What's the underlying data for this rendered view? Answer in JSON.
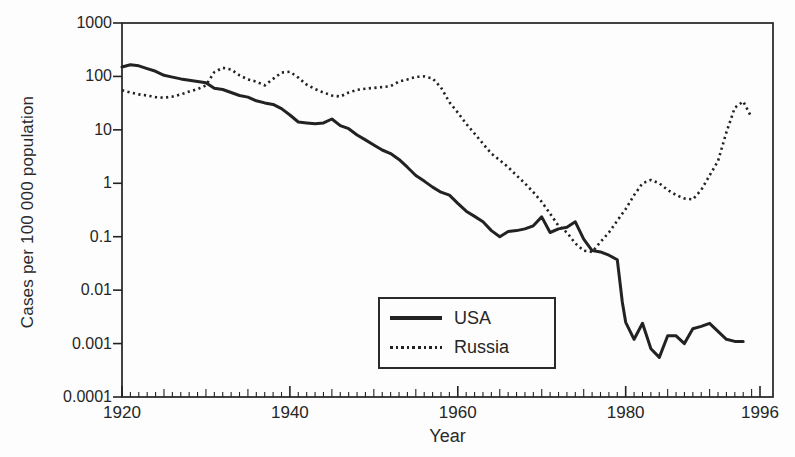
{
  "figure": {
    "background_color": "#fdfdfd",
    "ink_color": "#222222",
    "x_axis_title": "Year",
    "y_axis_title": "Cases per 100 000 population"
  },
  "chart_data": {
    "type": "line",
    "title": "",
    "xlabel": "Year",
    "ylabel": "Cases per 100 000 population",
    "grid": false,
    "x_axis": {
      "min": 1920,
      "max": 1996,
      "major_ticks": [
        1920,
        1940,
        1960,
        1980,
        1996
      ],
      "major_tick_labels": [
        "1920",
        "1940",
        "1960",
        "1980",
        "1996"
      ],
      "minor_tick_interval_years": 1
    },
    "y_axis": {
      "scale": "log",
      "min": 0.0001,
      "max": 1000,
      "ticks": [
        1000,
        100,
        10,
        1,
        0.1,
        0.01,
        0.001,
        0.0001
      ],
      "tick_labels": [
        "1000",
        "100",
        "10",
        "1",
        "0.1",
        "0.01",
        "0.001",
        "0.0001"
      ]
    },
    "legend": {
      "position": "inside-bottom-center",
      "entries": [
        {
          "label": "USA",
          "line_style": "solid"
        },
        {
          "label": "Russia",
          "line_style": "dotted"
        }
      ]
    },
    "series": [
      {
        "name": "USA",
        "line_style": "solid",
        "color": "#222222",
        "points": [
          [
            1920,
            150
          ],
          [
            1921,
            165
          ],
          [
            1922,
            158
          ],
          [
            1923,
            140
          ],
          [
            1924,
            125
          ],
          [
            1925,
            105
          ],
          [
            1926,
            97
          ],
          [
            1927,
            90
          ],
          [
            1928,
            85
          ],
          [
            1929,
            80
          ],
          [
            1930,
            76
          ],
          [
            1931,
            60
          ],
          [
            1932,
            57
          ],
          [
            1933,
            50
          ],
          [
            1934,
            44
          ],
          [
            1935,
            41
          ],
          [
            1936,
            35
          ],
          [
            1937,
            32
          ],
          [
            1938,
            30
          ],
          [
            1939,
            25
          ],
          [
            1940,
            19
          ],
          [
            1941,
            14
          ],
          [
            1942,
            13.5
          ],
          [
            1943,
            13
          ],
          [
            1944,
            13.5
          ],
          [
            1945,
            16
          ],
          [
            1946,
            12
          ],
          [
            1947,
            10.5
          ],
          [
            1948,
            8
          ],
          [
            1949,
            6.5
          ],
          [
            1950,
            5.2
          ],
          [
            1951,
            4.2
          ],
          [
            1952,
            3.6
          ],
          [
            1953,
            2.8
          ],
          [
            1954,
            2.0
          ],
          [
            1955,
            1.4
          ],
          [
            1956,
            1.1
          ],
          [
            1957,
            0.85
          ],
          [
            1958,
            0.68
          ],
          [
            1959,
            0.6
          ],
          [
            1960,
            0.42
          ],
          [
            1961,
            0.3
          ],
          [
            1962,
            0.24
          ],
          [
            1963,
            0.19
          ],
          [
            1964,
            0.13
          ],
          [
            1965,
            0.1
          ],
          [
            1966,
            0.125
          ],
          [
            1967,
            0.13
          ],
          [
            1968,
            0.14
          ],
          [
            1969,
            0.16
          ],
          [
            1970,
            0.235
          ],
          [
            1971,
            0.12
          ],
          [
            1972,
            0.14
          ],
          [
            1973,
            0.15
          ],
          [
            1974,
            0.19
          ],
          [
            1975,
            0.09
          ],
          [
            1976,
            0.055
          ],
          [
            1977,
            0.052
          ],
          [
            1978,
            0.045
          ],
          [
            1979,
            0.037
          ],
          [
            1979.6,
            0.006
          ],
          [
            1980,
            0.0025
          ],
          [
            1981,
            0.0012
          ],
          [
            1982,
            0.0024
          ],
          [
            1983,
            0.0008
          ],
          [
            1984,
            0.00055
          ],
          [
            1985,
            0.0014
          ],
          [
            1986,
            0.0014
          ],
          [
            1987,
            0.001
          ],
          [
            1988,
            0.0019
          ],
          [
            1989,
            0.0021
          ],
          [
            1990,
            0.0024
          ],
          [
            1991,
            0.0017
          ],
          [
            1992,
            0.0012
          ],
          [
            1993,
            0.0011
          ],
          [
            1994,
            0.0011
          ]
        ]
      },
      {
        "name": "Russia",
        "line_style": "dotted",
        "color": "#222222",
        "points": [
          [
            1920,
            55
          ],
          [
            1921,
            50
          ],
          [
            1922,
            46
          ],
          [
            1923,
            44
          ],
          [
            1924,
            41
          ],
          [
            1925,
            40
          ],
          [
            1926,
            42
          ],
          [
            1927,
            46
          ],
          [
            1928,
            52
          ],
          [
            1929,
            58
          ],
          [
            1930,
            68
          ],
          [
            1931,
            120
          ],
          [
            1932,
            145
          ],
          [
            1933,
            135
          ],
          [
            1934,
            105
          ],
          [
            1935,
            88
          ],
          [
            1936,
            80
          ],
          [
            1937,
            68
          ],
          [
            1938,
            90
          ],
          [
            1939,
            118
          ],
          [
            1940,
            122
          ],
          [
            1941,
            95
          ],
          [
            1942,
            70
          ],
          [
            1943,
            58
          ],
          [
            1944,
            50
          ],
          [
            1945,
            44
          ],
          [
            1946,
            42
          ],
          [
            1947,
            50
          ],
          [
            1948,
            56
          ],
          [
            1949,
            59
          ],
          [
            1950,
            61
          ],
          [
            1951,
            63
          ],
          [
            1952,
            66
          ],
          [
            1953,
            80
          ],
          [
            1954,
            88
          ],
          [
            1955,
            98
          ],
          [
            1956,
            100
          ],
          [
            1957,
            92
          ],
          [
            1958,
            62
          ],
          [
            1959,
            33
          ],
          [
            1960,
            21
          ],
          [
            1961,
            13
          ],
          [
            1962,
            8.5
          ],
          [
            1963,
            5.5
          ],
          [
            1964,
            3.6
          ],
          [
            1965,
            2.7
          ],
          [
            1966,
            2.0
          ],
          [
            1967,
            1.4
          ],
          [
            1968,
            1.0
          ],
          [
            1969,
            0.68
          ],
          [
            1970,
            0.45
          ],
          [
            1971,
            0.27
          ],
          [
            1972,
            0.16
          ],
          [
            1973,
            0.12
          ],
          [
            1974,
            0.075
          ],
          [
            1975,
            0.055
          ],
          [
            1976,
            0.052
          ],
          [
            1977,
            0.08
          ],
          [
            1978,
            0.12
          ],
          [
            1979,
            0.2
          ],
          [
            1980,
            0.33
          ],
          [
            1981,
            0.6
          ],
          [
            1982,
            1.0
          ],
          [
            1983,
            1.15
          ],
          [
            1984,
            1.0
          ],
          [
            1985,
            0.75
          ],
          [
            1986,
            0.6
          ],
          [
            1987,
            0.52
          ],
          [
            1988,
            0.5
          ],
          [
            1989,
            0.75
          ],
          [
            1990,
            1.4
          ],
          [
            1991,
            2.6
          ],
          [
            1992,
            9
          ],
          [
            1993,
            26
          ],
          [
            1994,
            34
          ],
          [
            1995,
            17
          ]
        ]
      }
    ]
  }
}
